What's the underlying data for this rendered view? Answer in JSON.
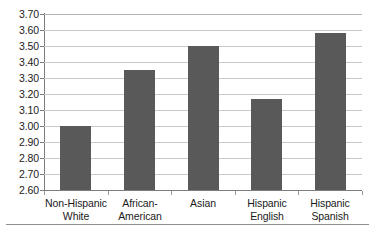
{
  "chart_data": {
    "type": "bar",
    "title": "",
    "subtitle": "",
    "xlabel": "",
    "ylabel": "",
    "categories": [
      "Non-Hispanic White",
      "African-American",
      "Asian",
      "Hispanic English",
      "Hispanic Spanish"
    ],
    "category_lines": [
      [
        "Non-Hispanic",
        "White"
      ],
      [
        "African-",
        "American"
      ],
      [
        "Asian"
      ],
      [
        "Hispanic",
        "English"
      ],
      [
        "Hispanic",
        "Spanish"
      ]
    ],
    "values": [
      3.0,
      3.35,
      3.5,
      3.17,
      3.58
    ],
    "ylim": [
      2.6,
      3.7
    ],
    "ytick_step": 0.1,
    "ytick_labels": [
      "3.70",
      "3.60",
      "3.50",
      "3.40",
      "3.30",
      "3.20",
      "3.10",
      "3.00",
      "2.90",
      "2.80",
      "2.70",
      "2.60"
    ],
    "ytick_values": [
      3.7,
      3.6,
      3.5,
      3.4,
      3.3,
      3.2,
      3.1,
      3.0,
      2.9,
      2.8,
      2.7,
      2.6
    ],
    "grid": true,
    "legend": false,
    "legend_position": "none",
    "bar_color": "#595959",
    "gridline_color": "#c9c9c9",
    "axis_color": "#7d7d7d",
    "background_color": "#ffffff",
    "text_color": "#1a1a1a"
  }
}
